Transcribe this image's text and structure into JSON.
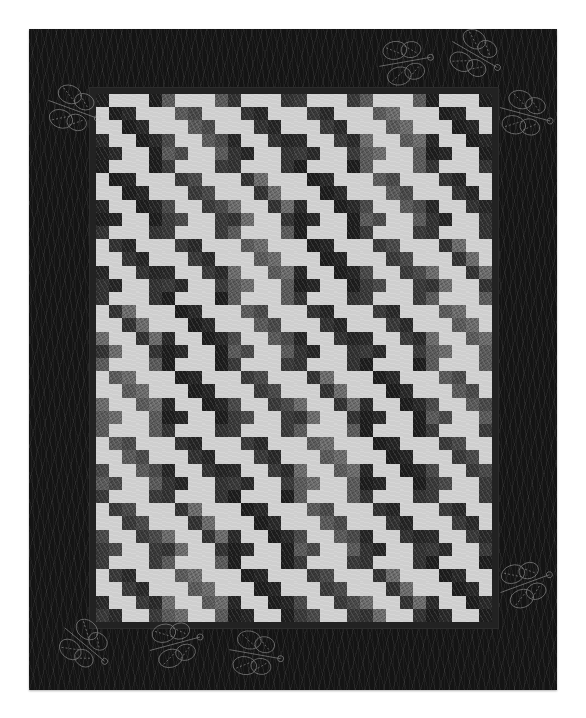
{
  "image": {
    "subject": "Black and white quilt with staggered staircase patchwork center and dark grass-print border with dragonfly quilting",
    "background_color": "#ffffff"
  },
  "quilt": {
    "border_color": "#141414",
    "inner_frame_color": "#222222",
    "light_fabric_color": "#cfcfcf",
    "dark_fabric_tones": [
      "#1e1e1e",
      "#2a2a2a",
      "#3a3a3a",
      "#4a4a4a",
      "#5c5c5c",
      "#6e6e6e",
      "#333333",
      "#262626"
    ],
    "grid": {
      "columns": 30,
      "rows": 40
    },
    "motif": {
      "size": 5,
      "pattern": [
        [
          1,
          0,
          0,
          0,
          1
        ],
        [
          0,
          1,
          1,
          0,
          0
        ],
        [
          0,
          0,
          1,
          1,
          0
        ],
        [
          1,
          0,
          0,
          1,
          1
        ],
        [
          1,
          1,
          0,
          0,
          1
        ]
      ]
    },
    "dragonflies": [
      {
        "x": 8,
        "y": 55,
        "rotate": 20
      },
      {
        "x": 340,
        "y": 8,
        "rotate": -10
      },
      {
        "x": 460,
        "y": 60,
        "rotate": 15
      },
      {
        "x": 410,
        "y": 0,
        "rotate": 30
      },
      {
        "x": 460,
        "y": 530,
        "rotate": -20
      },
      {
        "x": 20,
        "y": 590,
        "rotate": 40
      },
      {
        "x": 110,
        "y": 590,
        "rotate": -15
      },
      {
        "x": 190,
        "y": 600,
        "rotate": 10
      }
    ]
  }
}
